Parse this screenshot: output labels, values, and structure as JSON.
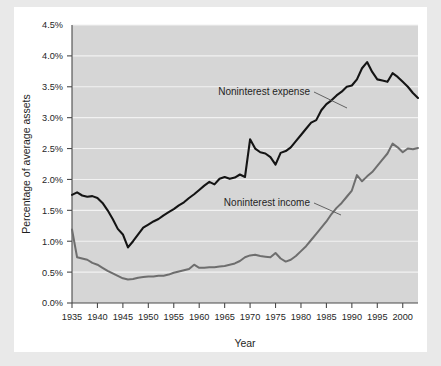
{
  "figure": {
    "background_color": "#e9e9e9",
    "card_color": "#ffffff",
    "plot_area_color": "#d6d6d6"
  },
  "chart_data": {
    "type": "line",
    "title": "",
    "xlabel": "Year",
    "ylabel": "Percentage of average assets",
    "xlim": [
      1935,
      2003
    ],
    "ylim": [
      0.0,
      4.5
    ],
    "grid": true,
    "legend_position": "inline-annotation",
    "x_tick_labels": [
      "1935",
      "1940",
      "1945",
      "1950",
      "1955",
      "1960",
      "1965",
      "1970",
      "1975",
      "1980",
      "1985",
      "1990",
      "1995",
      "2000"
    ],
    "x_ticks": [
      1935,
      1940,
      1945,
      1950,
      1955,
      1960,
      1965,
      1970,
      1975,
      1980,
      1985,
      1990,
      1995,
      2000
    ],
    "y_tick_labels": [
      "0.0%",
      "0.5%",
      "1.0%",
      "1.5%",
      "2.0%",
      "2.5%",
      "3.0%",
      "3.5%",
      "4.0%",
      "4.5%"
    ],
    "y_ticks": [
      0.0,
      0.5,
      1.0,
      1.5,
      2.0,
      2.5,
      3.0,
      3.5,
      4.0,
      4.5
    ],
    "x": [
      1935,
      1936,
      1937,
      1938,
      1939,
      1940,
      1941,
      1942,
      1943,
      1944,
      1945,
      1946,
      1947,
      1948,
      1949,
      1950,
      1951,
      1952,
      1953,
      1954,
      1955,
      1956,
      1957,
      1958,
      1959,
      1960,
      1961,
      1962,
      1963,
      1964,
      1965,
      1966,
      1967,
      1968,
      1969,
      1970,
      1971,
      1972,
      1973,
      1974,
      1975,
      1976,
      1977,
      1978,
      1979,
      1980,
      1981,
      1982,
      1983,
      1984,
      1985,
      1986,
      1987,
      1988,
      1989,
      1990,
      1991,
      1992,
      1993,
      1994,
      1995,
      1996,
      1997,
      1998,
      1999,
      2000,
      2001,
      2002,
      2003
    ],
    "series": [
      {
        "name": "Noninterest expense",
        "color": "#141414",
        "annotation": "Noninterest expense",
        "values": [
          1.75,
          1.79,
          1.74,
          1.72,
          1.73,
          1.7,
          1.62,
          1.5,
          1.36,
          1.2,
          1.11,
          0.9,
          1.0,
          1.11,
          1.22,
          1.27,
          1.32,
          1.36,
          1.42,
          1.47,
          1.52,
          1.58,
          1.63,
          1.7,
          1.76,
          1.83,
          1.9,
          1.96,
          1.92,
          2.01,
          2.04,
          2.01,
          2.03,
          2.08,
          2.04,
          2.65,
          2.5,
          2.44,
          2.42,
          2.36,
          2.24,
          2.43,
          2.46,
          2.52,
          2.62,
          2.72,
          2.82,
          2.92,
          2.96,
          3.12,
          3.22,
          3.28,
          3.36,
          3.42,
          3.5,
          3.52,
          3.62,
          3.8,
          3.9,
          3.74,
          3.62,
          3.6,
          3.58,
          3.72,
          3.66,
          3.58,
          3.5,
          3.4,
          3.32
        ]
      },
      {
        "name": "Noninterest income",
        "color": "#6e6e6e",
        "annotation": "Noninterest income",
        "values": [
          1.19,
          0.74,
          0.72,
          0.7,
          0.65,
          0.62,
          0.57,
          0.52,
          0.48,
          0.44,
          0.4,
          0.38,
          0.39,
          0.41,
          0.42,
          0.43,
          0.43,
          0.44,
          0.44,
          0.46,
          0.49,
          0.51,
          0.53,
          0.55,
          0.62,
          0.57,
          0.57,
          0.58,
          0.58,
          0.59,
          0.6,
          0.62,
          0.64,
          0.68,
          0.74,
          0.77,
          0.78,
          0.76,
          0.75,
          0.74,
          0.81,
          0.72,
          0.67,
          0.7,
          0.76,
          0.84,
          0.92,
          1.02,
          1.12,
          1.22,
          1.32,
          1.44,
          1.54,
          1.62,
          1.72,
          1.82,
          2.07,
          1.97,
          2.05,
          2.12,
          2.22,
          2.32,
          2.42,
          2.58,
          2.52,
          2.44,
          2.5,
          2.49,
          2.51
        ]
      }
    ]
  }
}
